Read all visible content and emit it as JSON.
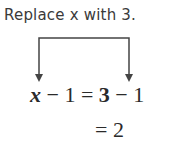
{
  "annotation": {
    "text": "Replace x with 3."
  },
  "equation": {
    "line1": {
      "var": "x",
      "lhs_rest": " − 1 = ",
      "sub": "3",
      "rhs_rest": " − 1"
    },
    "line2": {
      "text": "= 2"
    }
  },
  "colors": {
    "text": "#2a2a2a",
    "arrow": "#444444"
  }
}
